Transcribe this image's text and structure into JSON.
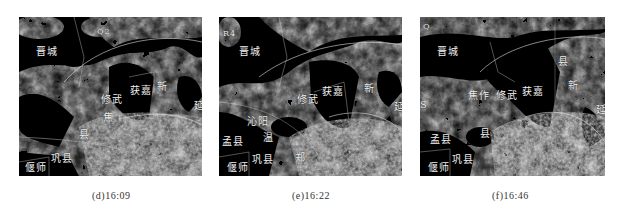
{
  "figure": {
    "panels": [
      {
        "id": "d",
        "caption": "(d)16:09",
        "marker": "Q2",
        "labels": {
          "jincheng": "晋城",
          "huojia": "获嘉",
          "xinxiang": "新",
          "xiuwu": "修武",
          "jiaozuo": "焦",
          "yan": "延",
          "wenxian": "温县",
          "mengxian": "孟县",
          "gongxian": "巩县",
          "yanshi": "偃师",
          "xian": "县"
        }
      },
      {
        "id": "e",
        "caption": "(e)16:22",
        "marker": "R4",
        "labels": {
          "jincheng": "晋城",
          "huojia": "获嘉",
          "xinxiang": "新",
          "xiuwu": "修武",
          "qinyang": "沁阳",
          "yan": "延",
          "wenxian": "温",
          "mengxian": "孟县",
          "gongxian": "巩县",
          "yanshi": "偃师",
          "zheng": "郑"
        }
      },
      {
        "id": "f",
        "caption": "(f)16:46",
        "marker": "Q",
        "labels": {
          "jincheng": "晋城",
          "huojia": "获嘉",
          "xinxiang": "新",
          "xiuwu": "修武",
          "jiaozuo": "焦作",
          "yan": "延",
          "mengxian": "孟县",
          "gongxian": "巩县",
          "yanshi": "偃师",
          "county": "县",
          "county2": "县",
          "s": "S"
        }
      }
    ]
  }
}
